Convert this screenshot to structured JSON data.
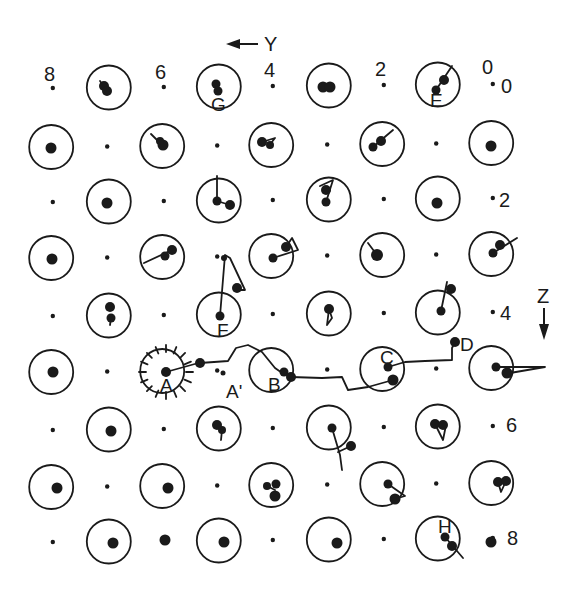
{
  "figure": {
    "type": "atomic-lattice-trajectory-diagram",
    "axes": {
      "y_axis": {
        "label": "Y",
        "direction": "left",
        "arrow_icon": "arrow-left-icon"
      },
      "z_axis": {
        "label": "Z",
        "direction": "down",
        "arrow_icon": "arrow-down-icon"
      }
    },
    "top_tick_labels": [
      "8",
      "6",
      "4",
      "2",
      "0"
    ],
    "right_tick_labels": [
      "0",
      "2",
      "4",
      "6",
      "8"
    ],
    "point_labels": [
      "A",
      "A'",
      "B",
      "C",
      "D",
      "E",
      "F",
      "G",
      "H"
    ],
    "colors": {
      "ink": "#1a1a1a",
      "background": "#ffffff"
    }
  }
}
